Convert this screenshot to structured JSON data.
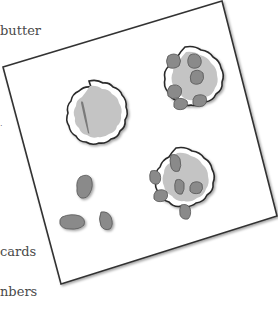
{
  "text_snippets": {
    "butter": "butter",
    "cards": "cards",
    "numbers": "nbers",
    "dot": "·"
  },
  "illustration": {
    "description": "Tilted card showing three cell-like dishes and loose clumps",
    "colors": {
      "card_border": "#333333",
      "dish_border": "#2a2a2a",
      "dish_fill": "#c8c8c8",
      "clump_fill": "#8a8a8a",
      "clump_stroke": "#555555"
    },
    "dishes": [
      {
        "name": "single-streak-dish",
        "contents": "one elongated streak"
      },
      {
        "name": "six-clump-dish",
        "contents": "six clumps"
      },
      {
        "name": "six-clump-cross-dish",
        "contents": "six clumps in cross arrangement"
      }
    ],
    "loose_clumps": 3
  }
}
